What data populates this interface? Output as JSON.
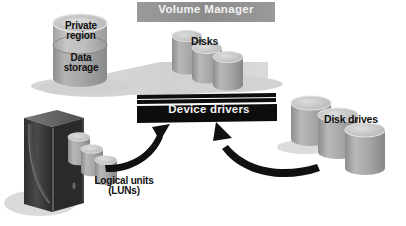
{
  "diagram": {
    "background_color": "#ffffff",
    "banner": {
      "label": "Volume Manager",
      "fill": "#8f8f8f",
      "text_color": "#f2f2f2"
    },
    "device_drivers_bar": {
      "label": "Device drivers",
      "fill": "#0d0d0d",
      "text_color": "#f5f5f5",
      "thin_bar_count": 2
    },
    "labels": {
      "private_region": "Private\nregion",
      "data_storage": "Data\nstorage",
      "disks": "Disks",
      "disk_drives": "Disk drives",
      "logical_units": "Logical units\n(LUNs)"
    },
    "colors": {
      "cylinder_body": "#a8a8a8",
      "cylinder_top": "#c9c9c9",
      "cylinder_band": "#bdbdbd",
      "cylinder_edge": "#6f6f6f",
      "platform": "#d6d6d6",
      "shadow": "#d9d9d9",
      "tower_front": "#3a3a3a",
      "tower_side": "#6b6b6b",
      "tower_top": "#8a8a8a",
      "arrow": "#111111"
    },
    "elements": {
      "storage_cylinder": "Private region / Data storage cylinder",
      "disk_cylinders_count": 3,
      "disk_drive_cylinders_count": 3,
      "lun_cylinders_count": 3,
      "computer_tower": "server tower",
      "arrow_left": "curved arrow from logical units up to device drivers",
      "arrow_right": "curved arrow from disk drives up to device drivers"
    }
  }
}
